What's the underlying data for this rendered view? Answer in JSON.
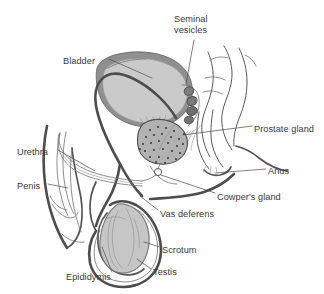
{
  "figure": {
    "type": "anatomical-diagram",
    "width": 324,
    "height": 294,
    "background_color": "#ffffff"
  },
  "colors": {
    "label_text": "#3a3a3a",
    "leader_line": "#4a4a4a",
    "bladder_wall": "#8a8a8a",
    "bladder_lumen": "#c9c9c9",
    "prostate_fill": "#b0b0b0",
    "prostate_stipple": "#2e2e2e",
    "seminal_vesicle_fill": "#7d7d7d",
    "testis_fill": "#c4c4c4",
    "outline": "#5a5a5a",
    "duct_dark": "#4d4d4d"
  },
  "labels": [
    {
      "id": "seminal-vesicles",
      "line1": "Seminal",
      "line2": "vesicles",
      "x": 174,
      "y": 14,
      "anchor": "start"
    },
    {
      "id": "bladder",
      "text": "Bladder",
      "x": 63,
      "y": 57,
      "anchor": "start"
    },
    {
      "id": "prostate-gland",
      "text": "Prostate gland",
      "x": 254,
      "y": 129,
      "anchor": "start"
    },
    {
      "id": "urethra",
      "text": "Urethra",
      "x": 17,
      "y": 152,
      "anchor": "start"
    },
    {
      "id": "anus",
      "text": "Anus",
      "x": 268,
      "y": 171,
      "anchor": "start"
    },
    {
      "id": "penis",
      "text": "Penis",
      "x": 17,
      "y": 186,
      "anchor": "start"
    },
    {
      "id": "cowpers-gland",
      "text": "Cowper's gland",
      "x": 217,
      "y": 197,
      "anchor": "start"
    },
    {
      "id": "vas-deferens",
      "text": "Vas deferens",
      "x": 160,
      "y": 214,
      "anchor": "start"
    },
    {
      "id": "scrotum",
      "text": "Scrotum",
      "x": 162,
      "y": 250,
      "anchor": "start"
    },
    {
      "id": "testis",
      "text": "Testis",
      "x": 153,
      "y": 272,
      "anchor": "start"
    },
    {
      "id": "epididymis",
      "text": "Epididymis",
      "x": 66,
      "y": 277,
      "anchor": "start"
    }
  ],
  "structures": [
    {
      "id": "bladder",
      "name": "Bladder"
    },
    {
      "id": "seminal-vesicles",
      "name": "Seminal vesicles"
    },
    {
      "id": "prostate-gland",
      "name": "Prostate gland"
    },
    {
      "id": "cowpers-gland",
      "name": "Cowper's gland"
    },
    {
      "id": "vas-deferens",
      "name": "Vas deferens"
    },
    {
      "id": "urethra",
      "name": "Urethra"
    },
    {
      "id": "penis",
      "name": "Penis"
    },
    {
      "id": "scrotum",
      "name": "Scrotum"
    },
    {
      "id": "testis",
      "name": "Testis"
    },
    {
      "id": "epididymis",
      "name": "Epididymis"
    },
    {
      "id": "anus",
      "name": "Anus"
    },
    {
      "id": "rectum",
      "name": "Rectum"
    }
  ]
}
